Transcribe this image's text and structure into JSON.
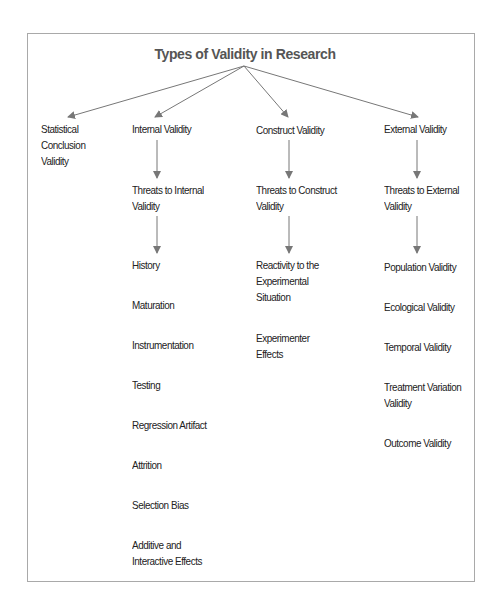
{
  "title": "Types of Validity in Research",
  "colors": {
    "arrow": "#777777",
    "border": "#a9a9a9",
    "title": "#555555",
    "text": "#222222"
  },
  "columns": [
    {
      "heading": "Statistical Conclusion Validity",
      "heading_lines": [
        "Statistical",
        "Conclusion",
        "Validity"
      ],
      "threats": null,
      "items": []
    },
    {
      "heading": "Internal Validity",
      "threats": "Threats to Internal Validity",
      "threats_lines": [
        "Threats to Internal",
        "Validity"
      ],
      "items": [
        {
          "label": "History"
        },
        {
          "label": "Maturation"
        },
        {
          "label": "Instrumentation"
        },
        {
          "label": "Testing"
        },
        {
          "label": "Regression Artifact"
        },
        {
          "label": "Attrition"
        },
        {
          "label": "Selection Bias"
        },
        {
          "label": "Additive and Interactive Effects",
          "lines": [
            "Additive and",
            "Interactive Effects"
          ]
        }
      ]
    },
    {
      "heading": "Construct Validity",
      "threats": "Threats to Construct Validity",
      "threats_lines": [
        "Threats to Construct",
        "Validity"
      ],
      "items": [
        {
          "label": "Reactivity to the Experimental Situation",
          "lines": [
            "Reactivity to the",
            "Experimental",
            "Situation"
          ]
        },
        {
          "label": "Experimenter Effects",
          "lines": [
            "Experimenter",
            "Effects"
          ]
        }
      ]
    },
    {
      "heading": "External Validity",
      "threats": "Threats to External Validity",
      "threats_lines": [
        "Threats to External",
        "Validity"
      ],
      "items": [
        {
          "label": "Population Validity"
        },
        {
          "label": "Ecological Validity"
        },
        {
          "label": "Temporal Validity"
        },
        {
          "label": "Treatment Variation Validity",
          "lines": [
            "Treatment Variation",
            "Validity"
          ]
        },
        {
          "label": "Outcome Validity"
        }
      ]
    }
  ]
}
